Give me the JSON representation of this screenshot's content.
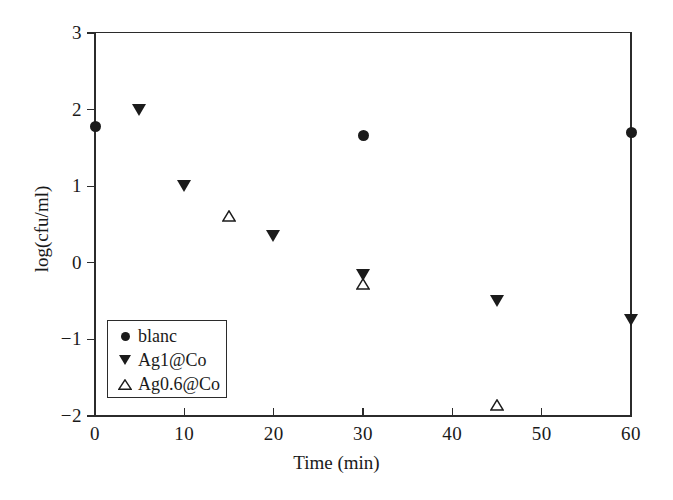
{
  "chart_data": {
    "type": "scatter",
    "title": "",
    "xlabel": "Time (min)",
    "ylabel": "log(cfu/ml)",
    "xlim": [
      0,
      60
    ],
    "ylim": [
      -2,
      3
    ],
    "xticks": [
      0,
      10,
      20,
      30,
      40,
      50,
      60
    ],
    "yticks": [
      -2,
      -1,
      0,
      1,
      2,
      3
    ],
    "xtick_labels": [
      "0",
      "10",
      "20",
      "30",
      "40",
      "50",
      "60"
    ],
    "ytick_labels": [
      "-2",
      "-1",
      "0",
      "1",
      "2",
      "3"
    ],
    "grid": false,
    "legend_position": "lower-left inside",
    "series": [
      {
        "name": "blanc",
        "marker": "filled-circle",
        "color": "#1b1b1b",
        "points": [
          {
            "x": 0,
            "y": 1.78
          },
          {
            "x": 30,
            "y": 1.66
          },
          {
            "x": 60,
            "y": 1.7
          }
        ]
      },
      {
        "name": "Ag1@Co",
        "marker": "filled-triangle-down",
        "color": "#1b1b1b",
        "points": [
          {
            "x": 5,
            "y": 2.0
          },
          {
            "x": 10,
            "y": 1.0
          },
          {
            "x": 20,
            "y": 0.35
          },
          {
            "x": 30,
            "y": -0.16
          },
          {
            "x": 45,
            "y": -0.5
          },
          {
            "x": 60,
            "y": -0.75
          }
        ]
      },
      {
        "name": "Ag0.6@Co",
        "marker": "open-triangle-up",
        "color": "#1b1b1b",
        "points": [
          {
            "x": 15,
            "y": 0.65
          },
          {
            "x": 30,
            "y": -0.24
          },
          {
            "x": 45,
            "y": -1.82
          }
        ]
      }
    ]
  },
  "legend": {
    "entries": [
      {
        "label": "blanc",
        "marker": "filled-circle"
      },
      {
        "label": "Ag1@Co",
        "marker": "filled-triangle-down"
      },
      {
        "label": "Ag0.6@Co",
        "marker": "open-triangle-up"
      }
    ]
  },
  "axes": {
    "x_title": "Time (min)",
    "y_title": "log(cfu/ml)"
  },
  "colors": {
    "marker": "#1b1b1b",
    "axis": "#2b2b2b",
    "background": "#ffffff"
  }
}
